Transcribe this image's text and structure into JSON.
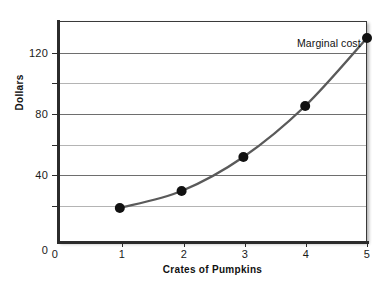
{
  "chart_data": {
    "type": "line",
    "title": "",
    "subtitle": "",
    "xlabel": "Crates of Pumpkins",
    "ylabel": "Dollars",
    "xlim": [
      0,
      5
    ],
    "ylim": [
      0,
      130
    ],
    "grid": true,
    "legend_position": "inline-annotation",
    "x": [
      1,
      2,
      3,
      4,
      5
    ],
    "series": [
      {
        "name": "Marginal cost",
        "values": [
          20,
          30,
          50,
          80,
          120
        ],
        "color": "#5a5a5a",
        "marker": "filled-circle",
        "marker_color": "#111111"
      }
    ],
    "x_ticks": [
      {
        "value": 0,
        "label": "0"
      },
      {
        "value": 1,
        "label": "1"
      },
      {
        "value": 2,
        "label": "2"
      },
      {
        "value": 3,
        "label": "3"
      },
      {
        "value": 4,
        "label": "4"
      },
      {
        "value": 5,
        "label": "5"
      }
    ],
    "y_ticks": [
      {
        "value": 0,
        "label": "0",
        "labeled": true,
        "gridline": false
      },
      {
        "value": 20,
        "label": "",
        "labeled": false,
        "gridline": true
      },
      {
        "value": 40,
        "label": "40",
        "labeled": true,
        "gridline": true
      },
      {
        "value": 60,
        "label": "",
        "labeled": false,
        "gridline": true
      },
      {
        "value": 80,
        "label": "80",
        "labeled": true,
        "gridline": true
      },
      {
        "value": 100,
        "label": "",
        "labeled": false,
        "gridline": true
      },
      {
        "value": 120,
        "label": "120",
        "labeled": true,
        "gridline": true
      }
    ],
    "annotations": [
      {
        "text": "Marginal cost",
        "anchor_x": 5,
        "anchor_y": 120
      }
    ]
  },
  "colors": {
    "background": "#ffffff",
    "plot_background": "#ffffff",
    "frame": "#3a3a3a",
    "axis": "#2b2b2b",
    "gridline_major": "#6e6e6e",
    "gridline_minor": "#b4b4b4",
    "curve": "#5a5a5a",
    "marker": "#111111",
    "text": "#111111"
  }
}
